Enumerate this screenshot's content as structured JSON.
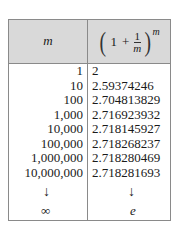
{
  "table": {
    "header": {
      "col1": "m",
      "col2": {
        "open_paren": "(",
        "one": "1",
        "plus": "+",
        "numerator": "1",
        "denominator": "m",
        "close_paren": ")",
        "exponent": "m"
      }
    },
    "rows": [
      {
        "m": "1",
        "value": "2"
      },
      {
        "m": "10",
        "value": "2.59374246"
      },
      {
        "m": "100",
        "value": "2.704813829"
      },
      {
        "m": "1,000",
        "value": "2.716923932"
      },
      {
        "m": "10,000",
        "value": "2.718145927"
      },
      {
        "m": "100,000",
        "value": "2.718268237"
      },
      {
        "m": "1,000,000",
        "value": "2.718280469"
      },
      {
        "m": "10,000,000",
        "value": "2.718281693"
      }
    ],
    "limit": {
      "arrow": "↓",
      "m": "∞",
      "value": "e"
    },
    "colors": {
      "header_bg": "#d9d9d9",
      "border": "#8a8a8a"
    }
  }
}
